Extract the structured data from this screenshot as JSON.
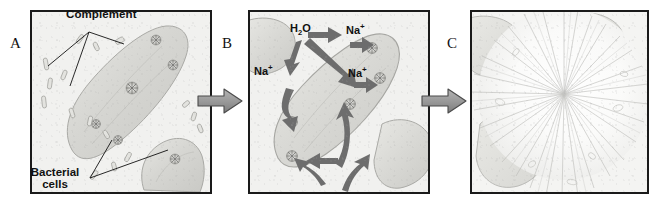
{
  "figure": {
    "background_color": "#ffffff",
    "panel_border_color": "#1a1a1a",
    "cell_color": "#d9d9d6",
    "flow_arrow_color": "#9a9a9a",
    "internal_arrow_color": "#6d6d6d"
  },
  "panels": [
    {
      "letter": "A",
      "name": "panel-a",
      "caption": "Complement proteins bind the bacterial cell surface",
      "labels": [
        {
          "text": "Complement",
          "name": "complement-label"
        },
        {
          "line1": "Bacterial",
          "line2": "cells",
          "name": "bacterial-cells-label"
        }
      ]
    },
    {
      "letter": "B",
      "name": "panel-b",
      "caption": "Membrane attack complex pores allow water and sodium influx",
      "ions": [
        {
          "name": "water-label",
          "species": "H",
          "sub": "2",
          "tail": "O",
          "sup": ""
        },
        {
          "name": "sodium-label-1",
          "species": "Na",
          "sub": "",
          "tail": "",
          "sup": "+"
        },
        {
          "name": "sodium-label-2",
          "species": "Na",
          "sub": "",
          "tail": "",
          "sup": "+"
        },
        {
          "name": "sodium-label-3",
          "species": "Na",
          "sub": "",
          "tail": "",
          "sup": "+"
        }
      ]
    },
    {
      "letter": "C",
      "name": "panel-c",
      "caption": "Osmotic swelling ruptures the cell (lysis)"
    }
  ],
  "flow_arrows": [
    {
      "name": "flow-arrow-a-to-b",
      "direction": "right"
    },
    {
      "name": "flow-arrow-b-to-c",
      "direction": "right"
    }
  ]
}
